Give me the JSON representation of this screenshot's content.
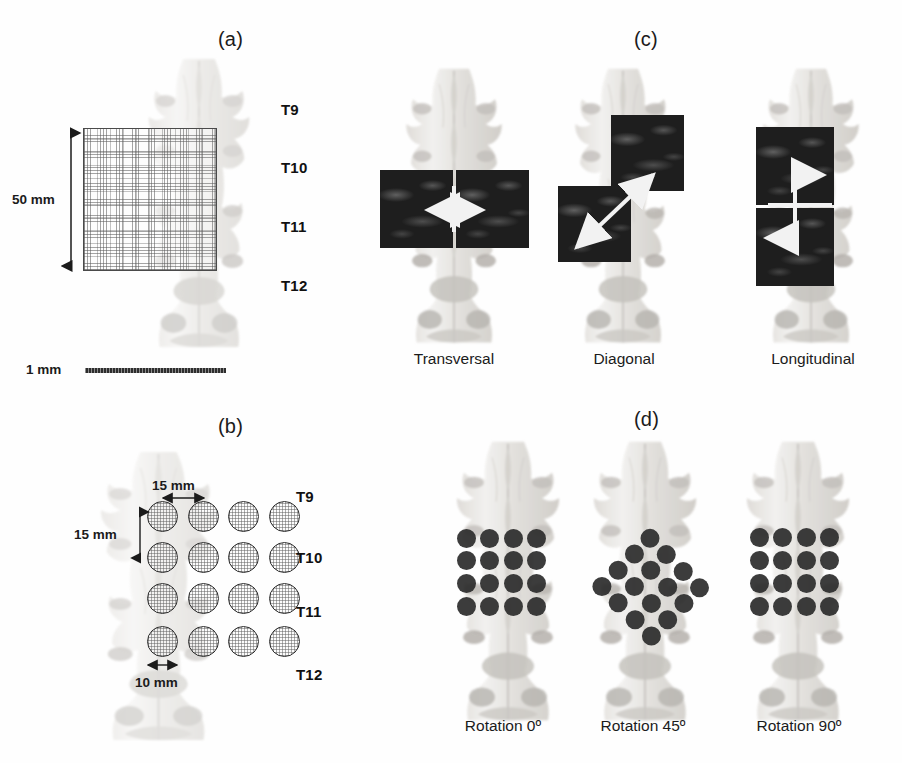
{
  "figure": {
    "background_color": "#ffffff",
    "panels": [
      {
        "id": "a",
        "letter": "(a)"
      },
      {
        "id": "b",
        "letter": "(b)"
      },
      {
        "id": "c",
        "letter": "(c)"
      },
      {
        "id": "d",
        "letter": "(d)"
      }
    ]
  },
  "panel_a": {
    "letter": "(a)",
    "vertebra_labels": [
      "T9",
      "T10",
      "T11",
      "T12"
    ],
    "dimension_label": "50 mm",
    "scalebar_label": "1 mm",
    "grid": {
      "rows": 16,
      "cols": 16
    }
  },
  "panel_b": {
    "letter": "(b)",
    "vertebra_labels": [
      "T9",
      "T10",
      "T11",
      "T12"
    ],
    "horizontal_spacing_label": "15 mm",
    "vertical_spacing_label": "15 mm",
    "diameter_label": "10 mm",
    "grid": {
      "rows": 4,
      "cols": 4
    }
  },
  "panel_c": {
    "letter": "(c)",
    "items": [
      {
        "label": "Transversal",
        "orientation": "horizontal",
        "arrow": "double-horizontal"
      },
      {
        "label": "Diagonal",
        "orientation": "diagonal",
        "arrow": "double-diagonal"
      },
      {
        "label": "Longitudinal",
        "orientation": "vertical",
        "arrow": "double-vertical"
      }
    ]
  },
  "panel_d": {
    "letter": "(d)",
    "items": [
      {
        "label": "Rotation 0º",
        "rotation_deg": 0,
        "dots": 16
      },
      {
        "label": "Rotation 45º",
        "rotation_deg": 45,
        "dots": 16
      },
      {
        "label": "Rotation 90º",
        "rotation_deg": 90,
        "dots": 16
      }
    ]
  },
  "colors": {
    "ink": "#1b1b1b",
    "tile_dark": "#1e1e1e",
    "dot_dark": "#2b2b2b",
    "arrow_white": "#f2f2f2",
    "bone_light": "#e7e5e2",
    "bone_mid": "#c9c6c2"
  }
}
